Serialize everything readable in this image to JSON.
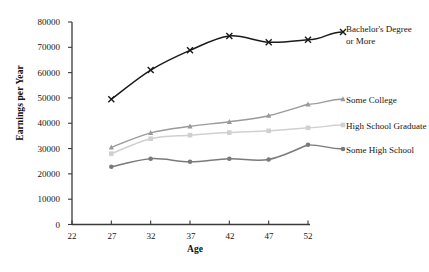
{
  "chart_data": {
    "type": "line",
    "title": "",
    "xlabel": "Age",
    "ylabel": "Earnings per Year",
    "x": [
      27,
      32,
      37,
      42,
      47,
      52
    ],
    "xlim": [
      22,
      52
    ],
    "ylim": [
      0,
      80000
    ],
    "xticks": [
      22,
      27,
      32,
      37,
      42,
      47,
      52
    ],
    "yticks": [
      0,
      10000,
      20000,
      30000,
      40000,
      50000,
      60000,
      70000,
      80000
    ],
    "xtick_labels": [
      "22",
      "27",
      "32",
      "37",
      "42",
      "47",
      "52"
    ],
    "ytick_labels": [
      "0",
      "10000",
      "20000",
      "30000",
      "40000",
      "50000",
      "60000",
      "70000",
      "80000"
    ],
    "grid": false,
    "legend_position": "right",
    "series": [
      {
        "name": "Bachelor's Degree\nor More",
        "color": "#1a1a1a",
        "marker": "x",
        "values": [
          49500,
          61000,
          68800,
          74500,
          72000,
          73000
        ]
      },
      {
        "name": "Some College",
        "color": "#9a9a9a",
        "marker": "triangle",
        "values": [
          30500,
          36200,
          38800,
          40600,
          43000,
          47500
        ]
      },
      {
        "name": "High School Graduate",
        "color": "#d0d0d0",
        "marker": "square",
        "values": [
          28000,
          33900,
          35300,
          36300,
          37000,
          38200
        ]
      },
      {
        "name": "Some High School",
        "color": "#7a7a7a",
        "marker": "circle",
        "values": [
          22800,
          26000,
          24800,
          26000,
          25700,
          31500
        ]
      }
    ]
  },
  "legend": {
    "entries": [
      {
        "label": "Bachelor's Degree\nor More"
      },
      {
        "label": "Some College"
      },
      {
        "label": "High School Graduate"
      },
      {
        "label": "Some High School"
      }
    ]
  },
  "axes": {
    "y_title": "Earnings per Year",
    "x_title": "Age"
  }
}
